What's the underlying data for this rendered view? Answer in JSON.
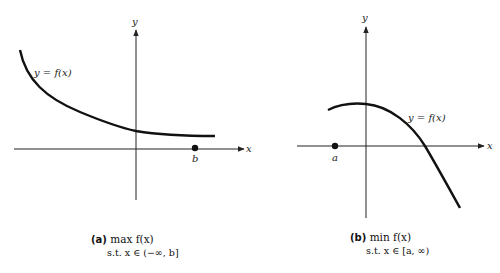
{
  "panels": [
    {
      "id": "a",
      "tag": "(a)",
      "objective": "max f(x)",
      "constraint": "s.t.   x ∈ (−∞, b]",
      "curve_label": "y = f(x)",
      "x_axis_label": "x",
      "y_axis_label": "y",
      "point_label": "b",
      "description": "Decreasing convex curve approaching a horizontal asymptote above the x-axis; feasible region is x ≤ b"
    },
    {
      "id": "b",
      "tag": "(b)",
      "objective": "min f(x)",
      "constraint": "s.t.   x ∈ [a, ∞)",
      "curve_label": "y = f(x)",
      "x_axis_label": "x",
      "y_axis_label": "y",
      "point_label": "a",
      "description": "Concave curve peaking near the y-axis, then decreasing without bound; feasible region is x ≥ a"
    }
  ],
  "colors": {
    "curve": "#111111",
    "axis": "#222222",
    "background": "#ffffff"
  }
}
